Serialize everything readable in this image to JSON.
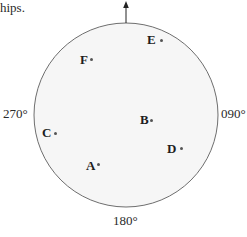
{
  "caption": {
    "fragment": "hips."
  },
  "diagram": {
    "type": "polar bearing plot",
    "north_arrow": true,
    "circle": {
      "cx": 126,
      "cy": 115,
      "r": 92,
      "fill": "#f6f6f6",
      "stroke": "#6e6e6e"
    },
    "bearings": {
      "west": "270°",
      "east": "090°",
      "south": "180°"
    },
    "points": [
      {
        "id": "A",
        "label": "A",
        "dot_x": 99,
        "dot_y": 165
      },
      {
        "id": "B",
        "label": "B",
        "dot_x": 152,
        "dot_y": 121
      },
      {
        "id": "C",
        "label": "C",
        "dot_x": 56,
        "dot_y": 134
      },
      {
        "id": "D",
        "label": "D",
        "dot_x": 182,
        "dot_y": 149
      },
      {
        "id": "E",
        "label": "E",
        "dot_x": 162,
        "dot_y": 41
      },
      {
        "id": "F",
        "label": "F",
        "dot_x": 92,
        "dot_y": 60
      }
    ]
  }
}
